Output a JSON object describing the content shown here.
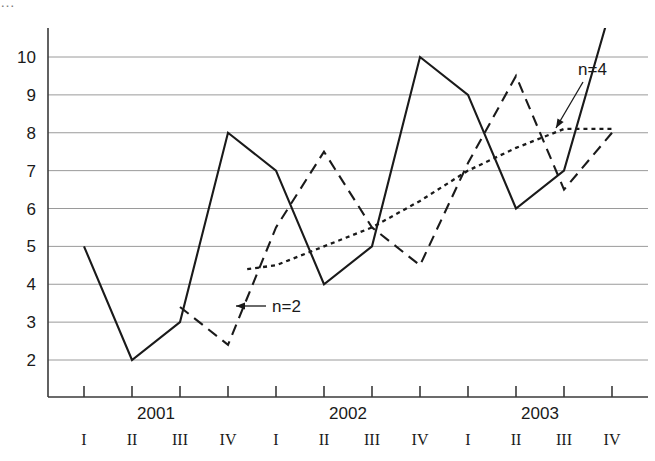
{
  "top_fragment": "…",
  "chart_data": {
    "type": "line",
    "title": "",
    "xlabel": "",
    "ylabel": "",
    "ylim": [
      2,
      10
    ],
    "yticks": [
      2,
      3,
      4,
      5,
      6,
      7,
      8,
      9,
      10
    ],
    "grid": true,
    "legend_position": "inline-annotations",
    "x_quarters": [
      "I",
      "II",
      "III",
      "IV",
      "I",
      "II",
      "III",
      "IV",
      "I",
      "II",
      "III",
      "IV"
    ],
    "x_years": [
      {
        "label": "2001",
        "center_index": 1.5
      },
      {
        "label": "2002",
        "center_index": 5.5
      },
      {
        "label": "2003",
        "center_index": 9.5
      }
    ],
    "series": [
      {
        "name": "raw",
        "style": "solid",
        "x": [
          0,
          1,
          2,
          3,
          4,
          5,
          6,
          7,
          8,
          9,
          10,
          11
        ],
        "values": [
          5,
          2,
          3,
          8,
          7,
          4,
          5,
          10,
          9,
          6,
          7,
          11.4
        ]
      },
      {
        "name": "n=2",
        "style": "dashed",
        "x": [
          2,
          3,
          4,
          5,
          6,
          7,
          8,
          9,
          10,
          11
        ],
        "values": [
          3.4,
          2.4,
          5.5,
          7.5,
          5.5,
          4.5,
          7.2,
          9.5,
          6.5,
          8.0
        ]
      },
      {
        "name": "n=4",
        "style": "dotted",
        "x": [
          3.4,
          4,
          5,
          6,
          7,
          8,
          9,
          10,
          11
        ],
        "values": [
          4.4,
          4.5,
          5.0,
          5.5,
          6.2,
          7.0,
          7.6,
          8.1,
          8.1
        ]
      }
    ],
    "annotations": [
      {
        "text": "n=2",
        "label_x": 272,
        "label_y": 312,
        "arrow_from_x": 266,
        "arrow_from_y": 306,
        "arrow_to_x": 236,
        "arrow_to_y": 306
      },
      {
        "text": "n=4",
        "label_x": 578,
        "label_y": 75,
        "arrow_from_x": 583,
        "arrow_from_y": 82,
        "arrow_to_x": 556,
        "arrow_to_y": 128
      }
    ],
    "colors": {
      "line": "#1a1a1a",
      "grid": "#9a9a9a",
      "axis": "#3a3a3a",
      "background": "#ffffff"
    }
  }
}
